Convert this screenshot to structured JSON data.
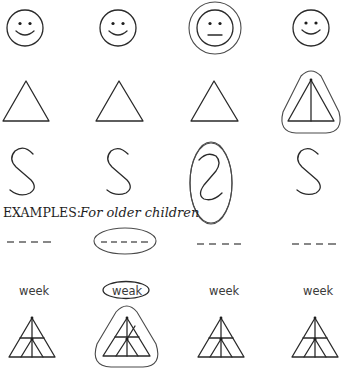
{
  "heading": {
    "prefix": "EXAMPLES:",
    "suffix": "For older children"
  },
  "rows": [
    {
      "name": "faces",
      "items": [
        {
          "type": "smiley-face",
          "circled": false
        },
        {
          "type": "smiley-face",
          "circled": false
        },
        {
          "type": "neutral-face",
          "circled": true
        },
        {
          "type": "smiley-face",
          "circled": false
        }
      ]
    },
    {
      "name": "triangles",
      "items": [
        {
          "type": "triangle",
          "circled": false
        },
        {
          "type": "triangle",
          "circled": false
        },
        {
          "type": "triangle",
          "circled": false
        },
        {
          "type": "triangle-with-center-line",
          "circled": true
        }
      ]
    },
    {
      "name": "letters",
      "items": [
        {
          "type": "letter-s",
          "circled": false
        },
        {
          "type": "letter-s",
          "circled": false
        },
        {
          "type": "reversed-letter-s",
          "circled": true
        },
        {
          "type": "letter-s",
          "circled": false
        }
      ]
    },
    {
      "name": "dashes",
      "items": [
        {
          "type": "dashes",
          "count": 4,
          "circled": false
        },
        {
          "type": "dashes",
          "count": 5,
          "circled": true
        },
        {
          "type": "dashes",
          "count": 4,
          "circled": false
        },
        {
          "type": "dashes",
          "count": 4,
          "circled": false
        }
      ]
    },
    {
      "name": "words",
      "items": [
        {
          "text": "week",
          "circled": false
        },
        {
          "text": "weak",
          "circled": true
        },
        {
          "text": "week",
          "circled": false
        },
        {
          "text": "week",
          "circled": false
        }
      ]
    },
    {
      "name": "divided-triangles",
      "items": [
        {
          "type": "divided-triangle",
          "circled": false
        },
        {
          "type": "divided-triangle-variant",
          "circled": true
        },
        {
          "type": "divided-triangle",
          "circled": false
        },
        {
          "type": "divided-triangle",
          "circled": false
        }
      ]
    }
  ],
  "colors": {
    "ink": "#2a2a2a",
    "background": "#ffffff"
  }
}
